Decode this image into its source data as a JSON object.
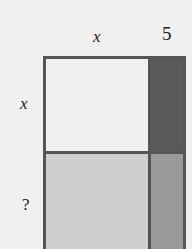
{
  "labels": {
    "top_left": "x",
    "top_right": "5",
    "side_top": "x",
    "side_bottom": "?"
  },
  "colors": {
    "background": "#f0f0ee",
    "region_top_left": "#f0f0ee",
    "region_top_right": "#5a5a5a",
    "region_bottom_left": "#cfcfcd",
    "region_bottom_right": "#9a9a98",
    "border": "#555555"
  }
}
